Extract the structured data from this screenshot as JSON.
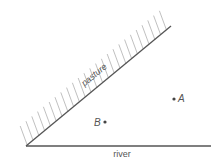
{
  "diagram": {
    "labels": {
      "pasture": "pasture",
      "river": "river",
      "point_a": "A",
      "point_b": "B"
    },
    "geometry": {
      "vertex": [
        26,
        146
      ],
      "pasture_edge_end": [
        171,
        26
      ],
      "river_end": [
        211,
        146
      ],
      "point_a": [
        174,
        99
      ],
      "point_b": [
        105,
        122
      ]
    },
    "colors": {
      "line": "#555555",
      "hatch": "#b0b0b0",
      "text": "#555555"
    }
  }
}
